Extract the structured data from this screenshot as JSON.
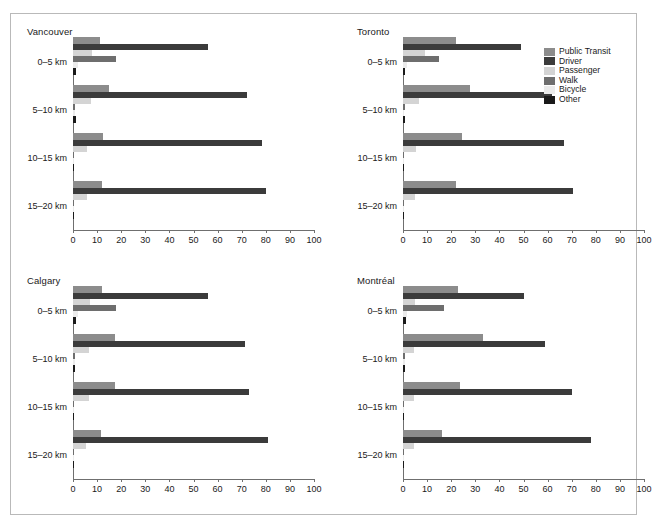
{
  "figure": {
    "border_color": "#b9b9b9",
    "background": "#ffffff"
  },
  "legend": {
    "position": "top-right",
    "entries": [
      {
        "label": "Public Transit",
        "color": "#8c8c8c"
      },
      {
        "label": "Driver",
        "color": "#3b3b3b"
      },
      {
        "label": "Passenger",
        "color": "#d4d4d4"
      },
      {
        "label": "Walk",
        "color": "#6e6e6e"
      },
      {
        "label": "Bicycle",
        "color": "#ebebeb"
      },
      {
        "label": "Other",
        "color": "#1a1a1a"
      }
    ]
  },
  "axis": {
    "xlim": [
      0,
      100
    ],
    "xticks": [
      0,
      10,
      20,
      30,
      40,
      50,
      60,
      70,
      80,
      90,
      100
    ],
    "xticklabels": [
      "0",
      "10",
      "20",
      "30",
      "40",
      "50",
      "60",
      "70",
      "80",
      "90",
      "100"
    ],
    "categories": [
      "0–5 km",
      "5–10 km",
      "10–15 km",
      "15–20 km"
    ],
    "grid": false
  },
  "chart_data": {
    "type": "bar",
    "orientation": "horizontal",
    "title": "",
    "xlabel": "",
    "ylabel": "",
    "xlim": [
      0,
      100
    ],
    "grid": false,
    "legend_position": "top-right",
    "categories": [
      "0–5 km",
      "5–10 km",
      "10–15 km",
      "15–20 km"
    ],
    "series_names": [
      "Public Transit",
      "Driver",
      "Passenger",
      "Walk",
      "Bicycle",
      "Other"
    ],
    "panels": [
      {
        "name": "Vancouver",
        "series": [
          {
            "name": "Public Transit",
            "color": "#8c8c8c",
            "values": [
              11,
              15,
              12.5,
              12
            ]
          },
          {
            "name": "Driver",
            "color": "#3b3b3b",
            "values": [
              56,
              72,
              78.5,
              80
            ]
          },
          {
            "name": "Passenger",
            "color": "#d4d4d4",
            "values": [
              8,
              7.5,
              6,
              6
            ]
          },
          {
            "name": "Walk",
            "color": "#6e6e6e",
            "values": [
              18,
              1,
              0.5,
              0.5
            ]
          },
          {
            "name": "Bicycle",
            "color": "#ebebeb",
            "values": [
              2,
              0.8,
              0.4,
              0.3
            ]
          },
          {
            "name": "Other",
            "color": "#1a1a1a",
            "values": [
              1.2,
              1.2,
              0.6,
              0.5
            ]
          }
        ]
      },
      {
        "name": "Toronto",
        "series": [
          {
            "name": "Public Transit",
            "color": "#8c8c8c",
            "values": [
              22,
              28,
              24.5,
              22
            ]
          },
          {
            "name": "Driver",
            "color": "#3b3b3b",
            "values": [
              49,
              62,
              67,
              70.5
            ]
          },
          {
            "name": "Passenger",
            "color": "#d4d4d4",
            "values": [
              9,
              6.5,
              5.5,
              5
            ]
          },
          {
            "name": "Walk",
            "color": "#6e6e6e",
            "values": [
              15,
              0.8,
              0.5,
              0.4
            ]
          },
          {
            "name": "Bicycle",
            "color": "#ebebeb",
            "values": [
              1.5,
              0.6,
              0.4,
              0.3
            ]
          },
          {
            "name": "Other",
            "color": "#1a1a1a",
            "values": [
              1,
              0.8,
              0.5,
              0.4
            ]
          }
        ]
      },
      {
        "name": "Calgary",
        "series": [
          {
            "name": "Public Transit",
            "color": "#8c8c8c",
            "values": [
              12,
              17.5,
              17.5,
              11.5
            ]
          },
          {
            "name": "Driver",
            "color": "#3b3b3b",
            "values": [
              56,
              71.5,
              73,
              81
            ]
          },
          {
            "name": "Passenger",
            "color": "#d4d4d4",
            "values": [
              7,
              6.5,
              6.5,
              5.5
            ]
          },
          {
            "name": "Walk",
            "color": "#6e6e6e",
            "values": [
              18,
              0.7,
              0.5,
              0.4
            ]
          },
          {
            "name": "Bicycle",
            "color": "#ebebeb",
            "values": [
              2,
              0.8,
              0.5,
              0.3
            ]
          },
          {
            "name": "Other",
            "color": "#1a1a1a",
            "values": [
              1.2,
              0.9,
              0.6,
              0.5
            ]
          }
        ]
      },
      {
        "name": "Montréal",
        "series": [
          {
            "name": "Public Transit",
            "color": "#8c8c8c",
            "values": [
              23,
              33,
              23.5,
              16
            ]
          },
          {
            "name": "Driver",
            "color": "#3b3b3b",
            "values": [
              50,
              59,
              70,
              78
            ]
          },
          {
            "name": "Passenger",
            "color": "#d4d4d4",
            "values": [
              5,
              4.5,
              4.5,
              4.5
            ]
          },
          {
            "name": "Walk",
            "color": "#6e6e6e",
            "values": [
              17,
              0.8,
              0.5,
              0.4
            ]
          },
          {
            "name": "Bicycle",
            "color": "#ebebeb",
            "values": [
              1.8,
              0.7,
              0.4,
              0.3
            ]
          },
          {
            "name": "Other",
            "color": "#1a1a1a",
            "values": [
              1.2,
              0.9,
              0.6,
              0.5
            ]
          }
        ]
      }
    ]
  }
}
